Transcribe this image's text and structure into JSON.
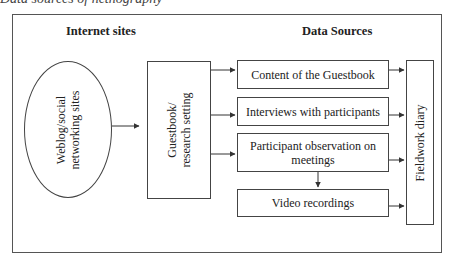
{
  "figure": {
    "cut_title": "Data sources of netnography"
  },
  "headings": {
    "internet_sites": "Internet sites",
    "data_sources": "Data Sources"
  },
  "nodes": {
    "weblog": {
      "line1": "Weblog/social",
      "line2": "networking sites"
    },
    "guestbook": {
      "line1": "Guestbook/",
      "line2": "research setting"
    },
    "sources": [
      {
        "label": "Content of the Guestbook"
      },
      {
        "label": "Interviews with participants"
      },
      {
        "label": "Participant observation on meetings"
      },
      {
        "label": "Video recordings"
      }
    ],
    "fieldwork": {
      "label": "Fieldwork diary"
    }
  },
  "colors": {
    "line": "#333333",
    "background": "#ffffff"
  }
}
